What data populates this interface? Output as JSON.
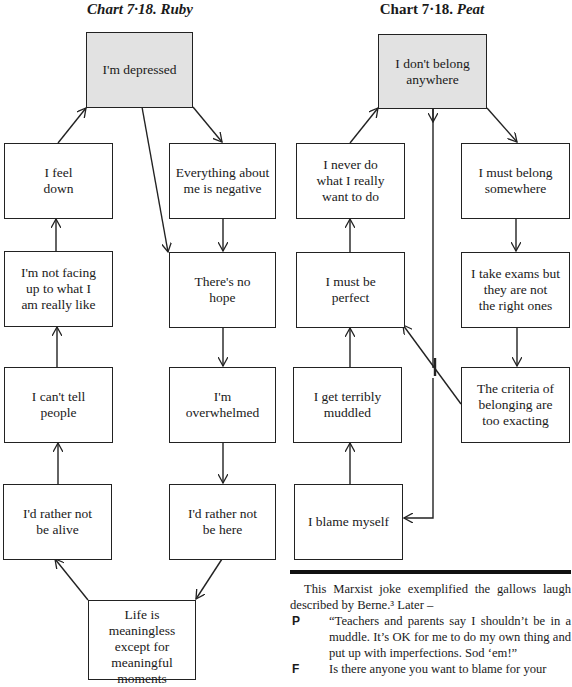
{
  "ruby_chart": {
    "title_prefix": "Chart 7·18.",
    "title_name": "Ruby",
    "nodes": {
      "depressed": "I'm depressed",
      "feel_down": "I feel\ndown",
      "everything_negative": "Everything about\nme is negative",
      "not_facing": "I'm not facing\nup to what I\nam really like",
      "no_hope": "There's no\nhope",
      "cant_tell": "I can't tell\npeople",
      "overwhelmed": "I'm\noverwhelmed",
      "not_alive": "I'd rather not\nbe alive",
      "not_here": "I'd rather not\nbe here",
      "meaningless": "Life is meaningless\nexcept for\nmeaningful\nmoments"
    }
  },
  "peat_chart": {
    "title_prefix": "Chart 7·18.",
    "title_name": "Peat",
    "nodes": {
      "dont_belong": "I don't belong\nanywhere",
      "never_do": "I never do\nwhat I really\nwant to do",
      "must_belong": "I must belong\nsomewhere",
      "must_be_perfect": "I must be\nperfect",
      "take_exams": "I take exams but\nthey are not\nthe right ones",
      "muddled": "I get terribly\nmuddled",
      "criteria": "The criteria of\nbelonging are\ntoo exacting",
      "blame_myself": "I blame myself"
    }
  },
  "text": {
    "paragraph": "This Marxist joke exemplified the gallows laugh described by Berne.³ Later –",
    "dialogue": [
      {
        "speaker": "P",
        "line": "“Teachers and parents say I shouldn’t be in a muddle. It’s OK for me to do my own thing and put up with imperfections. Sod ‘em!”"
      },
      {
        "speaker": "F",
        "line": "Is there anyone you want to blame for your"
      }
    ]
  }
}
